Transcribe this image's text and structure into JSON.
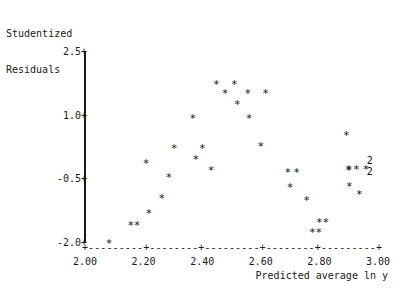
{
  "chart_data": {
    "type": "scatter",
    "title": "",
    "subtitle": "",
    "xlabel": "Predicted average ln y",
    "ylabel": "Studentized Residuals",
    "ylabel_lines": [
      "Studentized",
      "Residuals"
    ],
    "xlim": [
      2.0,
      3.0
    ],
    "ylim": [
      -2.0,
      2.5
    ],
    "xticks": [
      "2.00",
      "2.20",
      "2.40",
      "2.60",
      "2.80",
      "3.00"
    ],
    "xtick_values": [
      2.0,
      2.2,
      2.4,
      2.6,
      2.8,
      3.0
    ],
    "yticks": [
      "2.5",
      "1.0",
      "-0.5",
      "-2.0"
    ],
    "ytick_values": [
      2.5,
      1.0,
      -0.5,
      -2.0
    ],
    "grid": false,
    "legend": null,
    "marker": "*",
    "overplot_label": "2",
    "axis_style": "text-mode dashed x-axis with plus tick marks, solid vertical y-axis",
    "points": [
      {
        "x": 2.082,
        "y": -1.93,
        "label": "*",
        "count": 1
      },
      {
        "x": 2.156,
        "y": -1.5,
        "label": "*",
        "count": 1
      },
      {
        "x": 2.178,
        "y": -1.5,
        "label": "*",
        "count": 1
      },
      {
        "x": 2.218,
        "y": -1.22,
        "label": "*",
        "count": 1
      },
      {
        "x": 2.262,
        "y": -0.86,
        "label": "*",
        "count": 1
      },
      {
        "x": 2.208,
        "y": -0.05,
        "label": "*",
        "count": 1
      },
      {
        "x": 2.304,
        "y": 0.3,
        "label": "*",
        "count": 1
      },
      {
        "x": 2.286,
        "y": -0.38,
        "label": "*",
        "count": 1
      },
      {
        "x": 2.378,
        "y": 0.05,
        "label": "*",
        "count": 1
      },
      {
        "x": 2.4,
        "y": 0.3,
        "label": "*",
        "count": 1
      },
      {
        "x": 2.368,
        "y": 1.02,
        "label": "*",
        "count": 1
      },
      {
        "x": 2.43,
        "y": -0.2,
        "label": "*",
        "count": 1
      },
      {
        "x": 2.448,
        "y": 1.82,
        "label": "*",
        "count": 1
      },
      {
        "x": 2.478,
        "y": 1.6,
        "label": "*",
        "count": 1
      },
      {
        "x": 2.51,
        "y": 1.82,
        "label": "*",
        "count": 1
      },
      {
        "x": 2.52,
        "y": 1.34,
        "label": "*",
        "count": 1
      },
      {
        "x": 2.556,
        "y": 1.6,
        "label": "*",
        "count": 1
      },
      {
        "x": 2.56,
        "y": 1.02,
        "label": "*",
        "count": 1
      },
      {
        "x": 2.616,
        "y": 1.6,
        "label": "*",
        "count": 1
      },
      {
        "x": 2.6,
        "y": 0.36,
        "label": "*",
        "count": 1
      },
      {
        "x": 2.692,
        "y": -0.26,
        "label": "*",
        "count": 1
      },
      {
        "x": 2.722,
        "y": -0.26,
        "label": "*",
        "count": 1
      },
      {
        "x": 2.7,
        "y": -0.62,
        "label": "*",
        "count": 1
      },
      {
        "x": 2.756,
        "y": -0.92,
        "label": "*",
        "count": 1
      },
      {
        "x": 2.8,
        "y": -1.44,
        "label": "*",
        "count": 1
      },
      {
        "x": 2.822,
        "y": -1.44,
        "label": "*",
        "count": 1
      },
      {
        "x": 2.776,
        "y": -1.66,
        "label": "*",
        "count": 1
      },
      {
        "x": 2.798,
        "y": -1.66,
        "label": "*",
        "count": 1
      },
      {
        "x": 2.892,
        "y": 0.62,
        "label": "*",
        "count": 1
      },
      {
        "x": 2.9,
        "y": -0.18,
        "label": "*",
        "count": 1
      },
      {
        "x": 2.902,
        "y": -0.58,
        "label": "*",
        "count": 1
      },
      {
        "x": 2.926,
        "y": -0.18,
        "label": "*",
        "count": 1
      },
      {
        "x": 2.936,
        "y": -0.78,
        "label": "*",
        "count": 1
      },
      {
        "x": 2.958,
        "y": -0.18,
        "label": "*",
        "count": 1
      },
      {
        "x": 2.9,
        "y": -0.22,
        "label": "*",
        "count": 1
      },
      {
        "x": 2.972,
        "y": -0.05,
        "label": "2",
        "count": 2
      },
      {
        "x": 2.972,
        "y": -0.3,
        "label": "2",
        "count": 2
      }
    ]
  }
}
